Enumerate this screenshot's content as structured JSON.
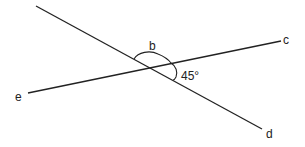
{
  "diagram": {
    "type": "intersecting-lines-angle",
    "stroke_color": "#222222",
    "background": "#ffffff",
    "lines": [
      {
        "name": "line-cd-transversal",
        "x1": 36,
        "y1": 6,
        "x2": 262,
        "y2": 129
      },
      {
        "name": "line-ec",
        "x1": 28,
        "y1": 93,
        "x2": 281,
        "y2": 41
      }
    ],
    "intersection": {
      "x": 148,
      "y": 68
    },
    "labels": {
      "c": "c",
      "e": "e",
      "d": "d",
      "b": "b",
      "angle": "45°"
    },
    "label_positions": {
      "c": {
        "x": 283,
        "y": 34
      },
      "e": {
        "x": 15,
        "y": 91
      },
      "d": {
        "x": 266,
        "y": 128
      },
      "b": {
        "x": 149,
        "y": 40
      },
      "angle": {
        "x": 181,
        "y": 70
      }
    }
  }
}
